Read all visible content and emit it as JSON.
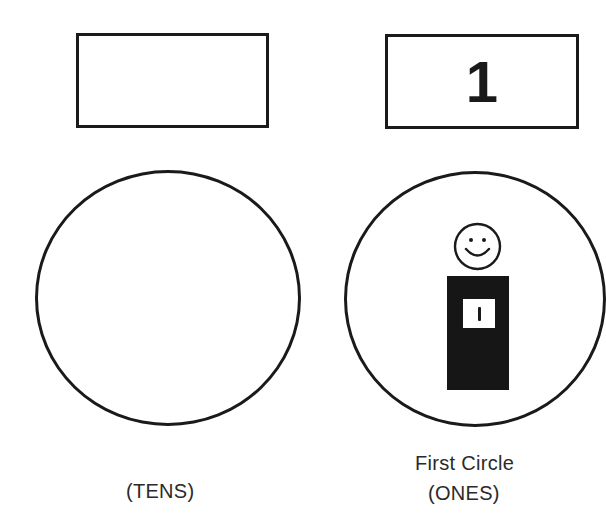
{
  "columns": [
    {
      "id": "tens",
      "box_value": "",
      "circle_contents": [],
      "caption_line1": "",
      "caption_line2": "(TENS)"
    },
    {
      "id": "ones",
      "box_value": "1",
      "circle_contents": [
        {
          "type": "person-figure",
          "head": "smiley-face",
          "body_color": "#161616",
          "tag_value": "I"
        }
      ],
      "caption_line1": "First Circle",
      "caption_line2": "(ONES)"
    }
  ],
  "colors": {
    "ink": "#1a1a1a",
    "background": "#ffffff"
  }
}
